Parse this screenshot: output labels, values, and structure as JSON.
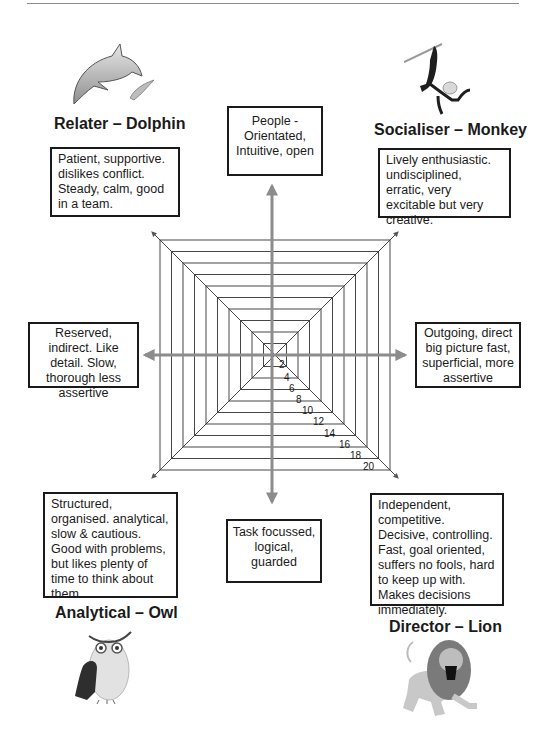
{
  "quadrants": {
    "relater": {
      "title": "Relater – Dolphin",
      "icon": "dolphin-icon",
      "description": "Patient, supportive. dislikes conflict. Steady, calm, good in a team."
    },
    "socialiser": {
      "title": "Socialiser – Monkey",
      "icon": "monkey-icon",
      "description": "Lively enthusiastic. undisciplined, erratic, very excitable but very creative."
    },
    "analytical": {
      "title": "Analytical – Owl",
      "icon": "owl-icon",
      "description": "Structured, organised. analytical, slow & cautious. Good with problems, but likes plenty of time to think about them."
    },
    "director": {
      "title": "Director – Lion",
      "icon": "lion-icon",
      "description": "Independent, competitive. Decisive, controlling. Fast, goal oriented, suffers no fools, hard to keep up with. Makes decisions immediately."
    }
  },
  "axes": {
    "top": "People - Orientated, Intuitive, open",
    "bottom": "Task focussed, logical, guarded",
    "left": "Reserved, indirect. Like detail. Slow, thorough less assertive",
    "right": "Outgoing, direct big picture fast, superficial, more assertive"
  },
  "scale": {
    "labels": [
      "2",
      "4",
      "6",
      "8",
      "10",
      "12",
      "14",
      "16",
      "18",
      "20"
    ]
  },
  "colors": {
    "axis_arrow": "#8c8c8c",
    "grid_line": "#333333",
    "text": "#1a1a1a"
  }
}
